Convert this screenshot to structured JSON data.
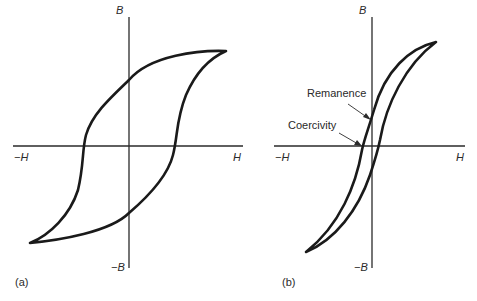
{
  "panels": [
    {
      "id": "a",
      "caption": "(a)",
      "axis_labels": {
        "pos_h": "H",
        "neg_h": "−H",
        "pos_b": "B",
        "neg_b": "−B"
      },
      "description": "Wide hysteresis loop (hard magnetic material)"
    },
    {
      "id": "b",
      "caption": "(b)",
      "axis_labels": {
        "pos_h": "H",
        "neg_h": "−H",
        "pos_b": "B",
        "neg_b": "−B"
      },
      "description": "Narrow hysteresis loop (soft magnetic material)",
      "annotations": [
        {
          "label": "Remanence"
        },
        {
          "label": "Coercivity"
        }
      ]
    }
  ],
  "colors": {
    "line": "#1a1a1a",
    "axis": "#2a2a2a",
    "background": "#ffffff"
  }
}
